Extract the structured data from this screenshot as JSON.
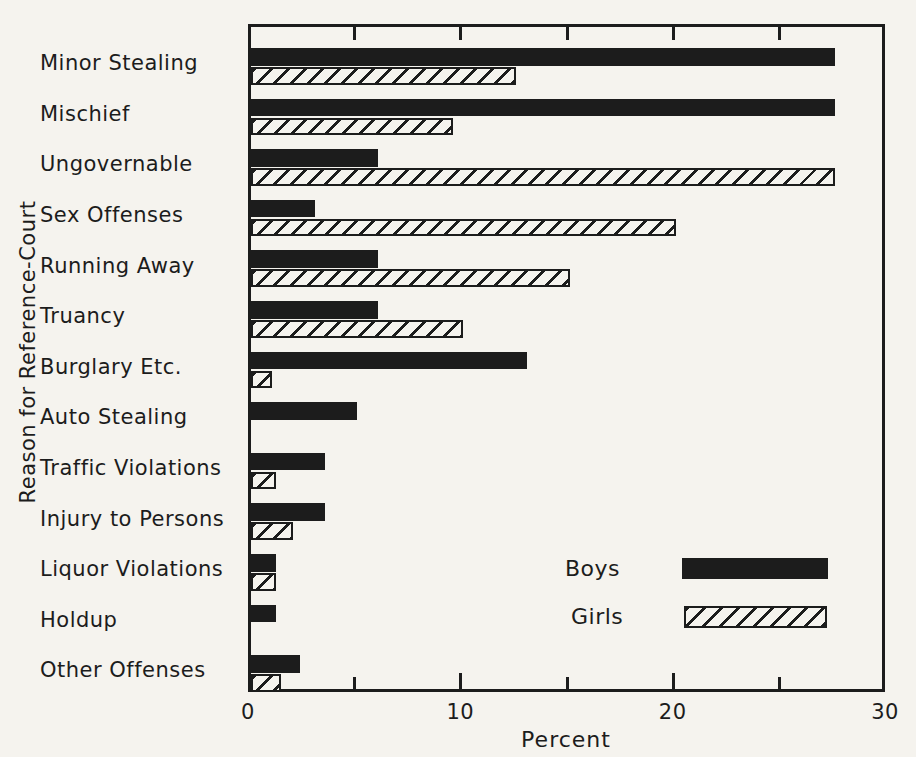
{
  "figure": {
    "paper_color": "#f5f3ee",
    "ink_color": "#1c1c1c"
  },
  "chart_data": {
    "type": "bar",
    "orientation": "horizontal",
    "title": "",
    "xlabel": "Percent",
    "ylabel": "Reason for Reference-Court",
    "xlim": [
      0,
      30
    ],
    "xticks_labeled": [
      0,
      10,
      20,
      30
    ],
    "xticks_minor": [
      5,
      10,
      15,
      20,
      25
    ],
    "grid": false,
    "legend_position": "inside-lower-right",
    "categories": [
      "Minor Stealing",
      "Mischief",
      "Ungovernable",
      "Sex Offenses",
      "Running Away",
      "Truancy",
      "Burglary Etc.",
      "Auto Stealing",
      "Traffic Violations",
      "Injury to Persons",
      "Liquor Violations",
      "Holdup",
      "Other Offenses"
    ],
    "series": [
      {
        "name": "Boys",
        "style": "solid-black",
        "values": [
          27.5,
          27.5,
          6,
          3,
          6,
          6,
          13,
          5,
          3.5,
          3.5,
          1.2,
          1.2,
          2.3
        ]
      },
      {
        "name": "Girls",
        "style": "diagonal-hatch",
        "values": [
          12.5,
          9.5,
          27.5,
          20,
          15,
          10,
          1,
          0,
          1.2,
          2,
          1.2,
          0,
          1.4
        ]
      }
    ]
  }
}
